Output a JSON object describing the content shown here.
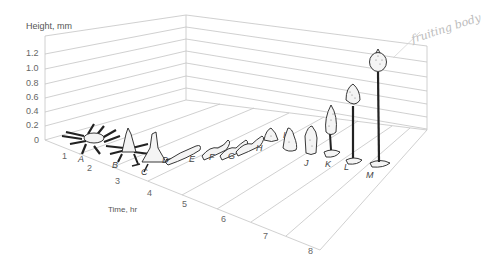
{
  "diagram": {
    "y_axis_label": "Height, mm",
    "x_axis_label": "Time, hr",
    "height_ticks": [
      "0",
      "0.2",
      "0.4",
      "0.6",
      "0.8",
      "1.0",
      "1.2"
    ],
    "time_ticks": [
      "1",
      "2",
      "3",
      "4",
      "5",
      "6",
      "7",
      "8"
    ],
    "stages": [
      "A",
      "B",
      "C",
      "D",
      "E",
      "F",
      "G",
      "H",
      "I",
      "J",
      "K",
      "L",
      "M"
    ],
    "annotation": "fruiting body",
    "colors": {
      "grid": "#bdbdbd",
      "ink": "#222222",
      "text": "#555555"
    }
  }
}
